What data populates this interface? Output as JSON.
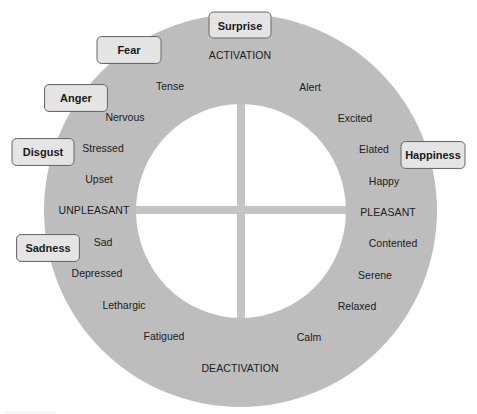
{
  "diagram": {
    "type": "circumplex-model-of-affect",
    "axes": {
      "top": "ACTIVATION",
      "bottom": "DEACTIVATION",
      "left": "UNPLEASANT",
      "right": "PLEASANT"
    },
    "affect_words": [
      {
        "id": "tense",
        "label": "Tense"
      },
      {
        "id": "nervous",
        "label": "Nervous"
      },
      {
        "id": "stressed",
        "label": "Stressed"
      },
      {
        "id": "upset",
        "label": "Upset"
      },
      {
        "id": "sad",
        "label": "Sad"
      },
      {
        "id": "depressed",
        "label": "Depressed"
      },
      {
        "id": "lethargic",
        "label": "Lethargic"
      },
      {
        "id": "fatigued",
        "label": "Fatigued"
      },
      {
        "id": "calm",
        "label": "Calm"
      },
      {
        "id": "relaxed",
        "label": "Relaxed"
      },
      {
        "id": "serene",
        "label": "Serene"
      },
      {
        "id": "contented",
        "label": "Contented"
      },
      {
        "id": "happy",
        "label": "Happy"
      },
      {
        "id": "elated",
        "label": "Elated"
      },
      {
        "id": "excited",
        "label": "Excited"
      },
      {
        "id": "alert",
        "label": "Alert"
      }
    ],
    "basic_emotions": [
      {
        "id": "surprise",
        "label": "Surprise"
      },
      {
        "id": "fear",
        "label": "Fear"
      },
      {
        "id": "anger",
        "label": "Anger"
      },
      {
        "id": "disgust",
        "label": "Disgust"
      },
      {
        "id": "sadness",
        "label": "Sadness"
      },
      {
        "id": "happiness",
        "label": "Happiness"
      }
    ],
    "colors": {
      "ring": "#bdbdbd",
      "inner": "#ffffff",
      "cross": "#c4c4c4",
      "emotion_box_fill": "#e4e4e4",
      "emotion_box_border": "#6a6a6a",
      "text": "#202020"
    }
  }
}
